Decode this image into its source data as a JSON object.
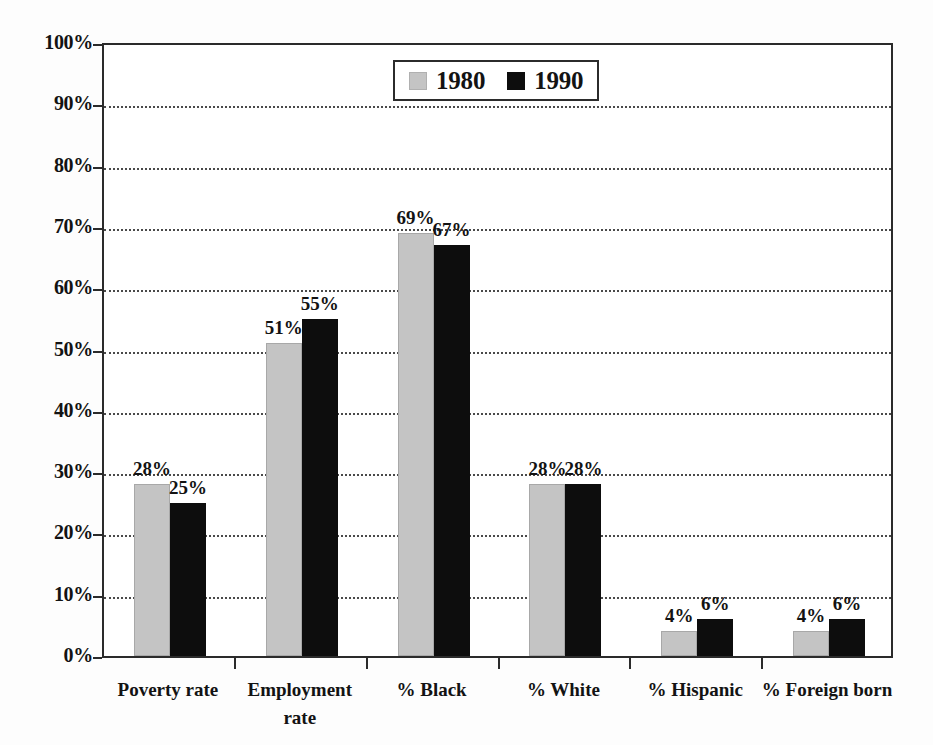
{
  "chart_data": {
    "type": "bar",
    "title": "",
    "subtitle": "",
    "xlabel": "",
    "ylabel": "",
    "ylim": [
      0,
      100
    ],
    "grid": true,
    "legend_position": "top-center",
    "y_unit": "%",
    "categories": [
      "Poverty rate",
      "Employment rate",
      "% Black",
      "% White",
      "% Hispanic",
      "% Foreign born"
    ],
    "category_lines": [
      [
        "Poverty rate"
      ],
      [
        "Employment",
        "rate"
      ],
      [
        "% Black"
      ],
      [
        "% White"
      ],
      [
        "% Hispanic"
      ],
      [
        "% Foreign born"
      ]
    ],
    "series": [
      {
        "name": "1980",
        "color": "#c4c4c4",
        "values": [
          28,
          51,
          69,
          28,
          4,
          4
        ],
        "labels": [
          "28%",
          "51%",
          "69%",
          "28%",
          "4%",
          "4%"
        ]
      },
      {
        "name": "1990",
        "color": "#0d0d0d",
        "values": [
          25,
          55,
          67,
          28,
          6,
          6
        ],
        "labels": [
          "25%",
          "55%",
          "67%",
          "28%",
          "6%",
          "6%"
        ]
      }
    ],
    "y_ticks": [
      0,
      10,
      20,
      30,
      40,
      50,
      60,
      70,
      80,
      90,
      100
    ],
    "y_tick_labels": [
      "0%",
      "10%",
      "20%",
      "30%",
      "40%",
      "50%",
      "60%",
      "70%",
      "80%",
      "90%",
      "100%"
    ]
  },
  "legend": {
    "entries": [
      {
        "label": "1980",
        "swatch": "light-gray-swatch"
      },
      {
        "label": "1990",
        "swatch": "black-swatch"
      }
    ]
  },
  "colors": {
    "series_1980": "#c4c4c4",
    "series_1990": "#0d0d0d",
    "axis": "#2b2b2b",
    "gridline": "#4a4a4a",
    "text": "#131313",
    "background": "#fdfdfd"
  }
}
